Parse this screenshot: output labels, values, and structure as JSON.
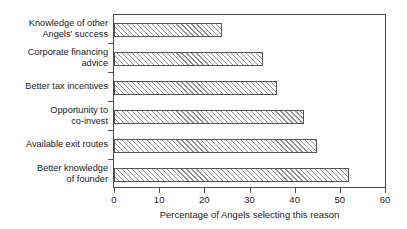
{
  "chart_data": {
    "type": "bar",
    "orientation": "horizontal",
    "title": "",
    "xlabel": "Percentage of Angels selecting this reason",
    "ylabel": "",
    "xlim": [
      0,
      60
    ],
    "xticks": [
      0,
      10,
      20,
      30,
      40,
      50,
      60
    ],
    "grid": false,
    "legend": null,
    "categories": [
      "Knowledge of other\nAngels' success",
      "Corporate financing\nadvice",
      "Better tax incentives",
      "Opportunity to\nco-invest",
      "Available exit routes",
      "Better knowledge\nof founder"
    ],
    "values": [
      24,
      33,
      36,
      42,
      45,
      52
    ],
    "series": [
      {
        "name": "Percentage of Angels selecting this reason",
        "values": [
          24,
          33,
          36,
          42,
          45,
          52
        ]
      }
    ],
    "style": {
      "bar_fill": "#ffffff",
      "bar_hatch": "/",
      "bar_hatch_color": "#8f8f8f",
      "bar_border": "#555555",
      "frame_color": "#4a4a4a",
      "background": "#ffffff",
      "text_color": "#1a1a1a"
    }
  },
  "axis": {
    "x_tick_labels": [
      "0",
      "10",
      "20",
      "30",
      "40",
      "50",
      "60"
    ],
    "x_title": "Percentage of Angels selecting this reason"
  },
  "category_labels": [
    "Knowledge of other\nAngels' success",
    "Corporate financing\nadvice",
    "Better tax incentives",
    "Opportunity to\nco-invest",
    "Available exit routes",
    "Better knowledge\nof founder"
  ]
}
